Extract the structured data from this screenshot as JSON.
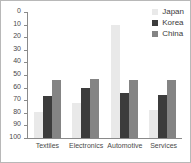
{
  "chart_data": {
    "type": "bar",
    "title": "",
    "subtitle": "",
    "xlabel": "",
    "ylabel": "",
    "ylim": [
      0,
      100
    ],
    "yticks": [
      0,
      10,
      20,
      30,
      40,
      50,
      60,
      70,
      80,
      90,
      100
    ],
    "grid": false,
    "legend_position": "top-right",
    "categories": [
      "Textiles",
      "Electronics",
      "Automotive",
      "Services"
    ],
    "series": [
      {
        "name": "Japan",
        "color": "#e9e9e9",
        "values": [
          21,
          28,
          90,
          22
        ]
      },
      {
        "name": "Korea",
        "color": "#3c3c3c",
        "values": [
          33,
          40,
          36,
          34
        ]
      },
      {
        "name": "China",
        "color": "#848484",
        "values": [
          46,
          47,
          46,
          46
        ]
      }
    ]
  },
  "axis": {
    "tick_labels": [
      "100",
      "90",
      "80",
      "70",
      "60",
      "50",
      "40",
      "30",
      "20",
      "10",
      "0"
    ]
  },
  "legend": {
    "items": [
      {
        "label": "Japan"
      },
      {
        "label": "Korea"
      },
      {
        "label": "China"
      }
    ]
  }
}
